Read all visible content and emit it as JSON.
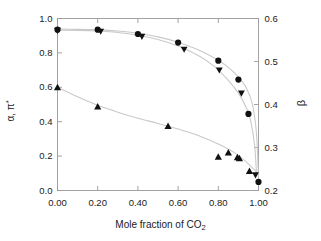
{
  "chart_data": {
    "type": "scatter",
    "title": "",
    "xlabel": "Mole fraction of CO2",
    "xlabel_parts": {
      "text": "Mole fraction of CO",
      "subscript": "2"
    },
    "ylabel_left": "α, π*",
    "ylabel_left_parts": {
      "text": "α, π",
      "superscript": "*"
    },
    "ylabel_right": "β",
    "xlim": [
      0.0,
      1.0
    ],
    "ylim_left": [
      0.0,
      1.0
    ],
    "ylim_right": [
      0.2,
      0.6
    ],
    "xticks": [
      "0.00",
      "0.20",
      "0.40",
      "0.60",
      "0.80",
      "1.00"
    ],
    "xtick_values": [
      0.0,
      0.2,
      0.4,
      0.6,
      0.8,
      1.0
    ],
    "yticks_left": [
      "0.0",
      "0.2",
      "0.4",
      "0.6",
      "0.8",
      "1.0"
    ],
    "ytick_values_left": [
      0.0,
      0.2,
      0.4,
      0.6,
      0.8,
      1.0
    ],
    "yticks_right": [
      "0.2",
      "0.3",
      "0.4",
      "0.5",
      "0.6"
    ],
    "ytick_values_right": [
      0.2,
      0.3,
      0.4,
      0.5,
      0.6
    ],
    "grid": false,
    "legend": "none",
    "frame": "box",
    "marker_color": "#111111",
    "curve_color": "#c9c9c9",
    "series": [
      {
        "name": "π*",
        "marker": "circle",
        "axis": "left",
        "x": [
          0.0,
          0.2,
          0.4,
          0.6,
          0.8,
          0.9,
          0.95,
          1.0
        ],
        "values": [
          0.935,
          0.935,
          0.91,
          0.86,
          0.755,
          0.645,
          0.445,
          0.05
        ]
      },
      {
        "name": "α",
        "marker": "triangle-down",
        "axis": "left",
        "x": [
          0.0,
          0.215,
          0.42,
          0.63,
          0.805,
          0.915,
          0.985
        ],
        "values": [
          0.93,
          0.925,
          0.895,
          0.82,
          0.7,
          0.565,
          0.09
        ]
      },
      {
        "name": "β",
        "marker": "triangle-up",
        "axis": "right",
        "x": [
          0.0,
          0.2,
          0.55,
          0.8,
          0.85,
          0.895,
          0.905,
          0.955
        ],
        "values": [
          0.44,
          0.395,
          0.35,
          0.278,
          0.288,
          0.277,
          0.275,
          0.245
        ]
      }
    ],
    "fit_curves": [
      {
        "name": "π*-fit",
        "axis": "left",
        "x": [
          0.0,
          0.1,
          0.2,
          0.3,
          0.4,
          0.5,
          0.6,
          0.7,
          0.8,
          0.86,
          0.9,
          0.94,
          0.97,
          0.99,
          1.0
        ],
        "values": [
          0.938,
          0.937,
          0.934,
          0.927,
          0.914,
          0.893,
          0.862,
          0.818,
          0.757,
          0.706,
          0.66,
          0.595,
          0.5,
          0.33,
          0.06
        ]
      },
      {
        "name": "α-fit",
        "axis": "left",
        "x": [
          0.0,
          0.1,
          0.2,
          0.3,
          0.4,
          0.5,
          0.6,
          0.7,
          0.78,
          0.85,
          0.9,
          0.94,
          0.96,
          0.98,
          0.99
        ],
        "values": [
          0.932,
          0.931,
          0.927,
          0.919,
          0.903,
          0.878,
          0.84,
          0.785,
          0.722,
          0.64,
          0.566,
          0.48,
          0.41,
          0.27,
          0.1
        ]
      },
      {
        "name": "β-fit",
        "axis": "right",
        "x": [
          0.0,
          0.1,
          0.2,
          0.3,
          0.4,
          0.5,
          0.6,
          0.7,
          0.8,
          0.88,
          0.94,
          0.98,
          1.0
        ],
        "values": [
          0.44,
          0.418,
          0.398,
          0.382,
          0.368,
          0.356,
          0.343,
          0.328,
          0.308,
          0.288,
          0.266,
          0.248,
          0.238
        ]
      }
    ]
  }
}
